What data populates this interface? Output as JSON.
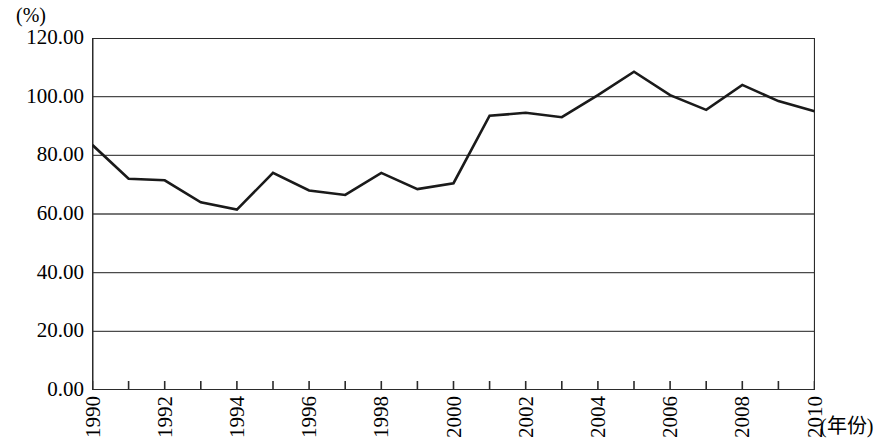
{
  "chart_data": {
    "type": "line",
    "title": "",
    "subtitle": "",
    "xlabel": "(年份)",
    "ylabel": "(%)",
    "x": [
      1990,
      1991,
      1992,
      1993,
      1994,
      1995,
      1996,
      1997,
      1998,
      1999,
      2000,
      2001,
      2002,
      2003,
      2004,
      2005,
      2006,
      2007,
      2008,
      2009,
      2010
    ],
    "series": [
      {
        "name": "",
        "values": [
          83.5,
          72.0,
          71.5,
          64.0,
          61.5,
          74.0,
          68.0,
          66.5,
          74.0,
          68.5,
          70.5,
          93.5,
          94.5,
          93.0,
          100.5,
          108.5,
          100.5,
          95.5,
          104.0,
          98.5,
          95.0
        ]
      }
    ],
    "categories": [
      "1990",
      "1991",
      "1992",
      "1993",
      "1994",
      "1995",
      "1996",
      "1997",
      "1998",
      "1999",
      "2000",
      "2001",
      "2002",
      "2003",
      "2004",
      "2005",
      "2006",
      "2007",
      "2008",
      "2009",
      "2010"
    ],
    "x_tick_labels": [
      "1990",
      "1992",
      "1994",
      "1996",
      "1998",
      "2000",
      "2002",
      "2004",
      "2006",
      "2008",
      "2010"
    ],
    "y_tick_labels": [
      "120.00",
      "100.00",
      "80.00",
      "60.00",
      "40.00",
      "20.00",
      "0.00"
    ],
    "y_tick_values": [
      120,
      100,
      80,
      60,
      40,
      20,
      0
    ],
    "ylim": [
      0,
      120
    ],
    "xlim": [
      1990,
      2010
    ],
    "grid": true,
    "grid_axis": "y",
    "legend": "none",
    "line_color": "#1a1a1a",
    "axis_color": "#2b2b2b",
    "grid_color": "#4a4a4a",
    "background_color": "#ffffff"
  },
  "axes": {
    "y_unit": "(%)",
    "x_unit": "(年份)"
  }
}
